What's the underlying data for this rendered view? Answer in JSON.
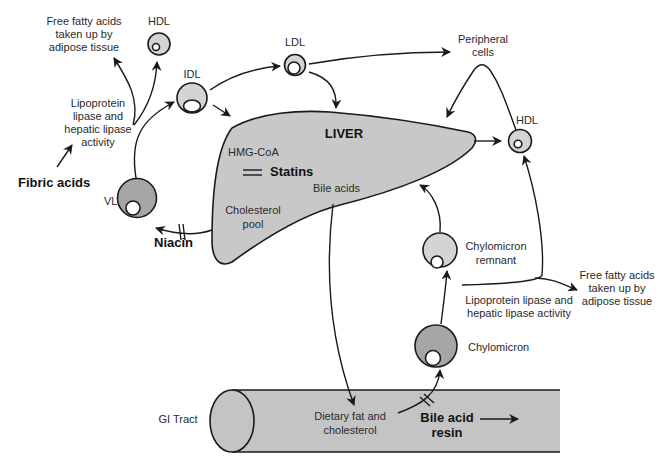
{
  "diagram": {
    "colors": {
      "liver_fill": "#c8c8c8",
      "light_particle": "#d4d4d4",
      "dark_particle": "#a6a6a6",
      "core": "#ffffff",
      "gi_tract_fill": "#c4c4c4",
      "stroke": "#1a1a1a"
    },
    "organs": {
      "liver": "LIVER",
      "gi_tract": "GI Tract"
    },
    "liver_contents": {
      "hmg_coa": "HMG-CoA",
      "statins": "Statins",
      "bile_acids": "Bile acids",
      "cholesterol_pool_1": "Cholesterol",
      "cholesterol_pool_2": "pool"
    },
    "particles": {
      "hdl_top_left": "HDL",
      "idl": "IDL",
      "ldl": "LDL",
      "hdl_right": "HDL",
      "vldl": "VLDL",
      "chylomicron_remnant_1": "Chylomicron",
      "chylomicron_remnant_2": "remnant",
      "chylomicron": "Chylomicron"
    },
    "labels": {
      "ffa_left_1": "Free fatty acids",
      "ffa_left_2": "taken up by",
      "ffa_left_3": "adipose tissue",
      "lipase_left_1": "Lipoprotein",
      "lipase_left_2": "lipase and",
      "lipase_left_3": "hepatic lipase",
      "lipase_left_4": "activity",
      "peripheral_1": "Peripheral",
      "peripheral_2": "cells",
      "ffa_right_1": "Free fatty acids",
      "ffa_right_2": "taken up by",
      "ffa_right_3": "adipose tissue",
      "lipase_right_1": "Lipoprotein lipase and",
      "lipase_right_2": "hepatic lipase activity",
      "dietary_1": "Dietary fat and",
      "dietary_2": "cholesterol"
    },
    "drugs": {
      "fibric_acids": "Fibric acids",
      "niacin": "Niacin",
      "statins": "Statins",
      "bile_acid_resin_1": "Bile acid",
      "bile_acid_resin_2": "resin"
    }
  }
}
